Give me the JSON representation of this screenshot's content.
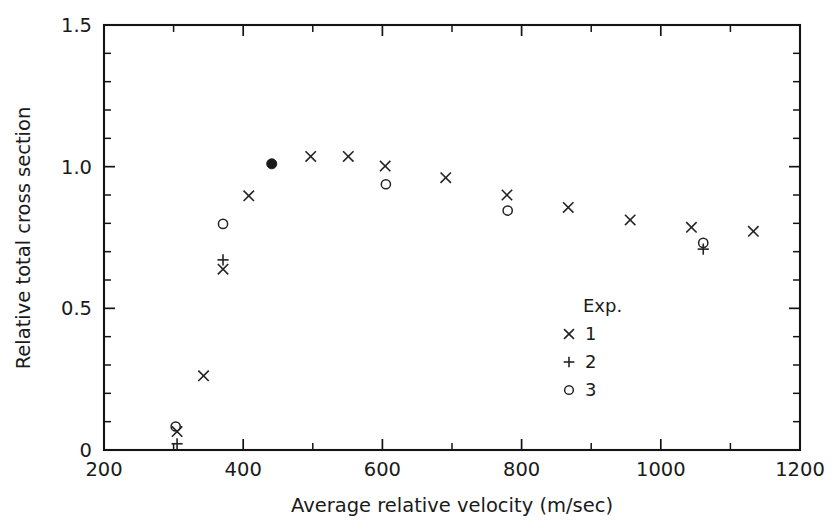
{
  "chart_data": {
    "type": "scatter",
    "title": "",
    "xlabel": "Average relative velocity (m/sec)",
    "ylabel": "Relative total cross section",
    "xlim": [
      200,
      1200
    ],
    "ylim": [
      0,
      1.5
    ],
    "x_major_ticks": [
      200,
      400,
      600,
      800,
      1000,
      1200
    ],
    "x_minor_interval": 100,
    "y_major_ticks": [
      0,
      0.5,
      1.0,
      1.5
    ],
    "y_minor_interval": 0.1,
    "x_ticklabels": [
      "200",
      "400",
      "600",
      "800",
      "1000",
      "1200"
    ],
    "y_ticklabels": [
      "0",
      "0.5",
      "1.0",
      "1.5"
    ],
    "grid": false,
    "legend_position": "inside-lower-right",
    "legend_title": "Exp.",
    "series": [
      {
        "name": "1",
        "marker": "cross",
        "points": [
          {
            "x": 305,
            "y": 0.065
          },
          {
            "x": 343,
            "y": 0.262
          },
          {
            "x": 371,
            "y": 0.638
          },
          {
            "x": 408,
            "y": 0.897
          },
          {
            "x": 497,
            "y": 1.036
          },
          {
            "x": 551,
            "y": 1.036
          },
          {
            "x": 604,
            "y": 1.002
          },
          {
            "x": 691,
            "y": 0.961
          },
          {
            "x": 779,
            "y": 0.9
          },
          {
            "x": 867,
            "y": 0.856
          },
          {
            "x": 956,
            "y": 0.812
          },
          {
            "x": 1044,
            "y": 0.786
          },
          {
            "x": 1133,
            "y": 0.772
          }
        ]
      },
      {
        "name": "2",
        "marker": "plus",
        "points": [
          {
            "x": 305,
            "y": 0.022
          },
          {
            "x": 371,
            "y": 0.671
          },
          {
            "x": 1061,
            "y": 0.709
          }
        ]
      },
      {
        "name": "3",
        "marker": "open-circle",
        "points": [
          {
            "x": 303,
            "y": 0.083
          },
          {
            "x": 371,
            "y": 0.798
          },
          {
            "x": 605,
            "y": 0.938
          },
          {
            "x": 780,
            "y": 0.845
          },
          {
            "x": 1061,
            "y": 0.731
          }
        ]
      },
      {
        "name": "peak",
        "marker": "filled-circle",
        "points": [
          {
            "x": 441,
            "y": 1.01
          }
        ]
      }
    ],
    "legend_entries": [
      {
        "marker": "cross",
        "label": "1"
      },
      {
        "marker": "plus",
        "label": "2"
      },
      {
        "marker": "open-circle",
        "label": "3"
      }
    ],
    "colors": {
      "axis": "#141414",
      "marker": "#232323",
      "background": "#ffffff"
    }
  },
  "caption_fragment": ""
}
